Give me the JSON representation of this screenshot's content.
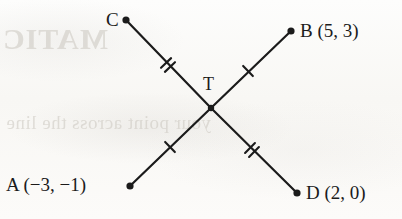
{
  "figure": {
    "kind": "geometry-diagram",
    "background_color": "#fbfbf9",
    "ink_color": "#1b1b1b"
  },
  "labels": {
    "point_c": "C",
    "point_b": "B (5, 3)",
    "point_t": "T",
    "point_a": "A (−3, −1)",
    "point_d": "D (2, 0)"
  },
  "points": [
    {
      "name": "C",
      "x": 126,
      "y": 20,
      "label": "C",
      "label_side": "left"
    },
    {
      "name": "B",
      "x": 291,
      "y": 31,
      "label": "B (5, 3)",
      "label_side": "right"
    },
    {
      "name": "T",
      "x": 211,
      "y": 108,
      "label": "T",
      "label_side": "above"
    },
    {
      "name": "A",
      "x": 130,
      "y": 186,
      "label": "A (−3, −1)",
      "label_side": "left"
    },
    {
      "name": "D",
      "x": 297,
      "y": 193,
      "label": "D (2, 0)",
      "label_side": "right"
    }
  ],
  "segments": [
    {
      "name": "CT",
      "from": "C",
      "to": "T",
      "ticks": 2
    },
    {
      "name": "TD",
      "from": "T",
      "to": "D",
      "ticks": 2
    },
    {
      "name": "AT",
      "from": "A",
      "to": "T",
      "ticks": 1
    },
    {
      "name": "TB",
      "from": "T",
      "to": "B",
      "ticks": 1
    }
  ],
  "tick_marks": [
    {
      "on_segment": "CT",
      "x": 168,
      "y": 65,
      "count": 2
    },
    {
      "on_segment": "TB",
      "x": 248,
      "y": 71,
      "count": 1
    },
    {
      "on_segment": "AT",
      "x": 170,
      "y": 147,
      "count": 1
    },
    {
      "on_segment": "TD",
      "x": 252,
      "y": 150,
      "count": 2
    }
  ],
  "background_bleed": {
    "title_ghost": "MATIC",
    "line_ghost": "your point across the line"
  }
}
